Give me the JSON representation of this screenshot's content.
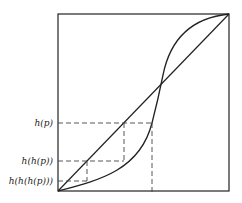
{
  "diagram": {
    "type": "function-iteration-plot",
    "labels": {
      "h_p": "h(p)",
      "h_h_p": "h(h(p))",
      "h_h_h_p": "h(h(h(p)))"
    },
    "elements": [
      "unit square frame",
      "diagonal y = x",
      "S-shaped curve h",
      "dashed cobweb lines"
    ],
    "colors": {
      "line": "#222222",
      "background": "#ffffff"
    }
  }
}
